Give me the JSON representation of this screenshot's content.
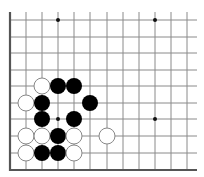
{
  "board": {
    "description": "Go board diagram fragment (lower-left corner region)",
    "colors": {
      "background": "#ffffff",
      "line": "#8a8a8a",
      "border": "#555555",
      "black_stone": "#000000",
      "white_stone_fill": "#ffffff",
      "white_stone_stroke": "#888888",
      "star_point": "#111111"
    },
    "grid": {
      "columns_x": [
        10,
        26,
        42,
        58,
        74,
        90,
        107,
        123,
        139,
        155,
        171,
        187
      ],
      "rows_y": [
        20,
        37,
        53,
        70,
        86,
        103,
        119,
        136,
        153,
        170
      ],
      "line_right_end_x": 197,
      "left_border": true,
      "bottom_border": true,
      "top_edge_open": true,
      "right_edge_open": true
    },
    "star_points": [
      {
        "col": 3,
        "row": 0
      },
      {
        "col": 9,
        "row": 0
      },
      {
        "col": 3,
        "row": 6
      },
      {
        "col": 9,
        "row": 6
      }
    ],
    "stones": [
      {
        "color": "white",
        "col": 2,
        "row": 4
      },
      {
        "color": "black",
        "col": 3,
        "row": 4
      },
      {
        "color": "black",
        "col": 4,
        "row": 4
      },
      {
        "color": "white",
        "col": 1,
        "row": 5
      },
      {
        "color": "black",
        "col": 2,
        "row": 5
      },
      {
        "color": "black",
        "col": 5,
        "row": 5
      },
      {
        "color": "black",
        "col": 2,
        "row": 6
      },
      {
        "color": "black",
        "col": 4,
        "row": 6
      },
      {
        "color": "white",
        "col": 1,
        "row": 7
      },
      {
        "color": "white",
        "col": 2,
        "row": 7
      },
      {
        "color": "black",
        "col": 3,
        "row": 7
      },
      {
        "color": "white",
        "col": 4,
        "row": 7
      },
      {
        "color": "white",
        "col": 6,
        "row": 7
      },
      {
        "color": "white",
        "col": 1,
        "row": 8
      },
      {
        "color": "black",
        "col": 2,
        "row": 8
      },
      {
        "color": "black",
        "col": 3,
        "row": 8
      },
      {
        "color": "white",
        "col": 4,
        "row": 8
      }
    ],
    "stone_radius": 8,
    "star_radius": 2
  }
}
